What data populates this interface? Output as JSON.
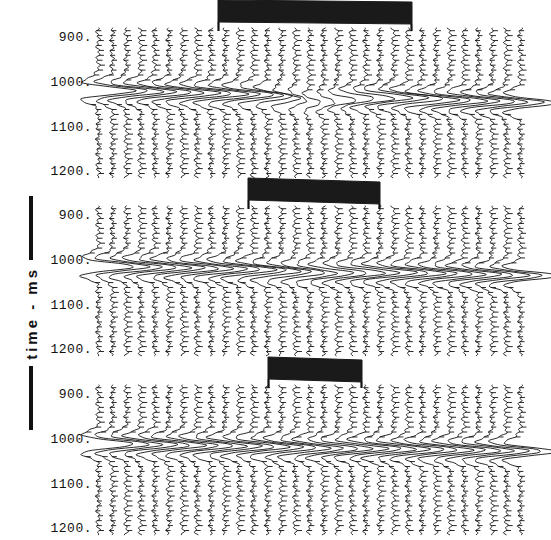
{
  "figure": {
    "type": "seismic-wiggle-trace-display",
    "width": 551,
    "height": 540,
    "background": "#ffffff",
    "ink_color": "#111111",
    "marker_bar_color": "#1a1a1a"
  },
  "axis": {
    "title": "time - ms",
    "orientation": "vertical",
    "tick_labels": [
      "900.",
      "1000.",
      "1100.",
      "1200."
    ],
    "tick_values": [
      900,
      1000,
      1100,
      1200
    ],
    "range_ms": [
      880,
      1215
    ],
    "units": "ms",
    "direction": "increasing-downward"
  },
  "panels": [
    {
      "id": "panel-1",
      "name": "top-panel",
      "trace_count": 31,
      "marker_bar": {
        "label": "coverage-bar-1",
        "start_trace": 9,
        "end_trace": 23,
        "x_start": 218,
        "x_end": 412,
        "width_px": 194,
        "slant_px": 2
      }
    },
    {
      "id": "panel-2",
      "name": "middle-panel",
      "trace_count": 31,
      "marker_bar": {
        "label": "coverage-bar-2",
        "start_trace": 11,
        "end_trace": 21,
        "x_start": 248,
        "x_end": 380,
        "width_px": 132,
        "slant_px": 4
      }
    },
    {
      "id": "panel-3",
      "name": "bottom-panel",
      "trace_count": 31,
      "marker_bar": {
        "label": "coverage-bar-3",
        "start_trace": 13,
        "end_trace": 20,
        "x_start": 268,
        "x_end": 362,
        "width_px": 94,
        "slant_px": 3
      }
    }
  ],
  "chart_data": {
    "type": "line",
    "title": "",
    "xlabel": "",
    "ylabel": "time - ms",
    "ylim": [
      880,
      1215
    ],
    "yticks": [
      900,
      1000,
      1100,
      1200
    ],
    "ytick_labels": [
      "900.",
      "1000.",
      "1100.",
      "1200."
    ],
    "grid": false,
    "legend": "none",
    "trace_x_start": 98,
    "trace_x_end": 520,
    "trace_spacing_px": 14.07,
    "series": [
      {
        "name": "panel-1-traces",
        "trace_count": 31,
        "event_time_ms": 1020,
        "event_moveout_ms_per_trace": 0.9,
        "residual_ms": [
          0,
          0,
          0,
          0,
          0,
          0,
          0,
          0,
          0,
          0,
          0,
          0,
          2,
          5,
          9,
          14,
          11,
          6,
          2,
          0,
          -2,
          -3,
          -2,
          0,
          0,
          0,
          0,
          0,
          0,
          0,
          0
        ],
        "amplitude": [
          1.0,
          1.0,
          1.0,
          1.0,
          1.0,
          1.0,
          1.0,
          1.0,
          1.0,
          1.0,
          0.95,
          0.85,
          0.7,
          0.5,
          0.35,
          0.3,
          0.35,
          0.5,
          0.65,
          0.8,
          0.9,
          0.95,
          1.0,
          1.0,
          1.0,
          1.0,
          1.0,
          1.0,
          1.0,
          1.0,
          1.0
        ],
        "coherence": "disrupted-center"
      },
      {
        "name": "panel-2-traces",
        "trace_count": 31,
        "event_time_ms": 1015,
        "event_moveout_ms_per_trace": 0.7,
        "residual_ms": [
          0,
          0,
          0,
          0,
          0,
          0,
          0,
          0,
          0,
          0,
          0,
          1,
          2,
          3,
          4,
          5,
          4,
          3,
          2,
          1,
          0,
          0,
          0,
          0,
          0,
          0,
          0,
          0,
          0,
          0,
          0
        ],
        "amplitude": [
          1.0,
          1.0,
          1.0,
          1.0,
          1.0,
          1.0,
          1.0,
          1.0,
          1.0,
          1.0,
          1.0,
          0.95,
          0.9,
          0.85,
          0.8,
          0.78,
          0.8,
          0.85,
          0.9,
          0.95,
          1.0,
          1.0,
          1.0,
          1.0,
          1.0,
          1.0,
          1.0,
          1.0,
          1.0,
          1.0,
          1.0
        ],
        "coherence": "mostly-coherent"
      },
      {
        "name": "panel-3-traces",
        "trace_count": 31,
        "event_time_ms": 1012,
        "event_moveout_ms_per_trace": 0.55,
        "residual_ms": [
          0,
          0,
          0,
          0,
          0,
          0,
          0,
          0,
          0,
          0,
          0,
          0,
          0,
          1,
          1,
          2,
          1,
          1,
          0,
          0,
          0,
          0,
          0,
          0,
          0,
          0,
          0,
          0,
          0,
          0,
          0
        ],
        "amplitude": [
          1.0,
          1.0,
          1.0,
          1.0,
          1.0,
          1.0,
          1.0,
          1.0,
          1.0,
          1.0,
          1.0,
          1.0,
          1.0,
          0.98,
          0.96,
          0.95,
          0.96,
          0.98,
          1.0,
          1.0,
          1.0,
          1.0,
          1.0,
          1.0,
          1.0,
          1.0,
          1.0,
          1.0,
          1.0,
          1.0,
          1.0
        ],
        "coherence": "coherent"
      }
    ]
  }
}
